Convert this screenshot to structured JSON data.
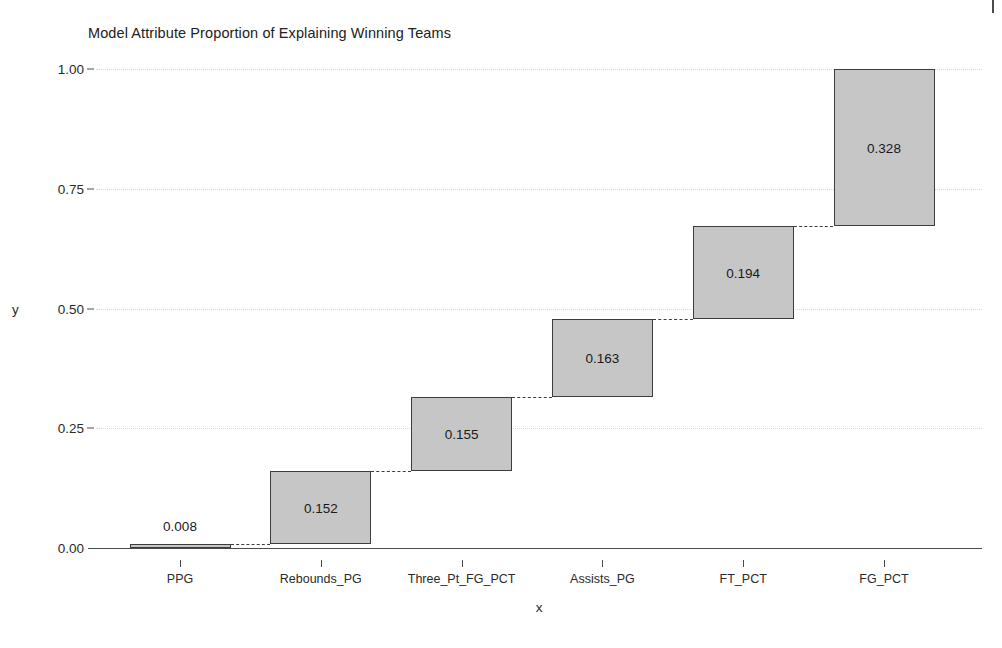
{
  "chart_data": {
    "type": "bar",
    "chart_variant": "waterfall",
    "title": "Model Attribute Proportion of Explaining Winning Teams",
    "xlabel": "x",
    "ylabel": "y",
    "categories": [
      "PPG",
      "Rebounds_PG",
      "Three_Pt_FG_PCT",
      "Assists_PG",
      "FT_PCT",
      "FG_PCT"
    ],
    "values": [
      0.008,
      0.152,
      0.155,
      0.163,
      0.194,
      0.328
    ],
    "value_labels": [
      "0.008",
      "0.152",
      "0.155",
      "0.163",
      "0.194",
      "0.328"
    ],
    "cumulative_start": [
      0.0,
      0.008,
      0.16,
      0.315,
      0.478,
      0.672
    ],
    "cumulative_end": [
      0.008,
      0.16,
      0.315,
      0.478,
      0.672,
      1.0
    ],
    "ylim": [
      0.0,
      1.0
    ],
    "ytick_values": [
      1.0,
      0.75,
      0.5,
      0.25,
      0.0
    ],
    "ytick_labels": [
      "1.00",
      "0.75",
      "0.50",
      "0.25",
      "0.00"
    ],
    "grid": true,
    "legend": "none",
    "bar_fill_color": "#c6c6c6",
    "bar_border_color": "#3d3d3d",
    "connector_style": "dashed",
    "gridline_color": "#d8d8d8",
    "axis_color": "#4a4a4a",
    "label_placement": [
      "above",
      "inside",
      "inside",
      "inside",
      "inside",
      "inside"
    ]
  }
}
